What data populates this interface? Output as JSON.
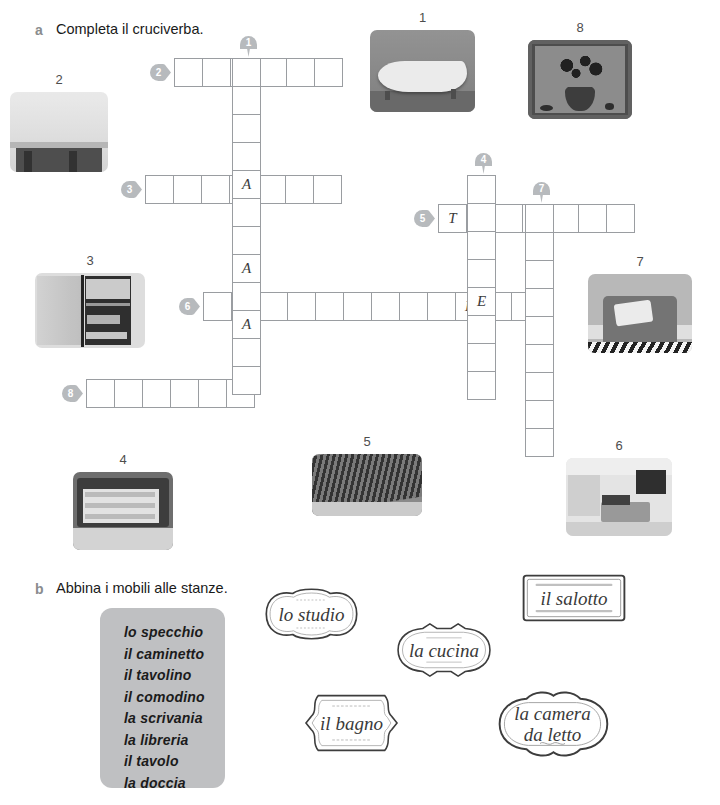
{
  "page": {
    "width": 720,
    "height": 805,
    "background": "#ffffff",
    "grid_border_color": "#9a9da1",
    "pin_color": "#b7babd",
    "wordbox_color": "#bfc0c2"
  },
  "exercise_a": {
    "letter": "a",
    "title": "Completa il cruciverba."
  },
  "exercise_b": {
    "letter": "b",
    "title": "Abbina i mobili alle stanze."
  },
  "crossword": {
    "cell_size": 29,
    "entries": [
      {
        "number": "2",
        "direction": "across",
        "x": 174,
        "y": 58,
        "cells": 6,
        "letters": [
          "",
          "",
          "",
          "",
          "",
          ""
        ]
      },
      {
        "number": "3",
        "direction": "across",
        "x": 145,
        "y": 175,
        "cells": 7,
        "letters": [
          "",
          "",
          "",
          "A",
          "",
          "",
          ""
        ]
      },
      {
        "number": "5",
        "direction": "across",
        "x": 438,
        "y": 204,
        "cells": 7,
        "letters": [
          "T",
          "",
          "",
          "",
          "",
          "",
          ""
        ]
      },
      {
        "number": "6",
        "direction": "across",
        "x": 203,
        "y": 292,
        "cells": 12,
        "letters": [
          "",
          "A",
          "",
          "",
          "",
          "",
          "",
          "",
          "",
          "E",
          "",
          ""
        ]
      },
      {
        "number": "8",
        "direction": "across",
        "x": 86,
        "y": 379,
        "cells": 6,
        "letters": [
          "",
          "",
          "",
          "",
          "",
          ""
        ]
      },
      {
        "number": "1",
        "direction": "down",
        "x": 232,
        "y": 58,
        "cells": 12,
        "letters": [
          "",
          "",
          "",
          "",
          "A",
          "",
          "",
          "A",
          "",
          "A",
          "",
          ""
        ]
      },
      {
        "number": "4",
        "direction": "down",
        "x": 467,
        "y": 175,
        "cells": 8,
        "letters": [
          "",
          "",
          "",
          "",
          "E",
          "",
          "",
          ""
        ]
      },
      {
        "number": "7",
        "direction": "down",
        "x": 525,
        "y": 204,
        "cells": 9,
        "letters": [
          "",
          "",
          "",
          "",
          "",
          "",
          "",
          "",
          ""
        ]
      }
    ],
    "pins": [
      {
        "number": "1",
        "style": "down",
        "x": 240,
        "y": 36
      },
      {
        "number": "2",
        "style": "right",
        "x": 150,
        "y": 64
      },
      {
        "number": "3",
        "style": "right",
        "x": 121,
        "y": 181
      },
      {
        "number": "4",
        "style": "down",
        "x": 475,
        "y": 153
      },
      {
        "number": "5",
        "style": "right",
        "x": 414,
        "y": 210
      },
      {
        "number": "6",
        "style": "right",
        "x": 179,
        "y": 298
      },
      {
        "number": "7",
        "style": "down",
        "x": 533,
        "y": 182
      },
      {
        "number": "8",
        "style": "right",
        "x": 62,
        "y": 385
      }
    ]
  },
  "photos": [
    {
      "id": "photo-1",
      "number": "1",
      "subject": "bathtub",
      "x": 370,
      "y": 30,
      "w": 105,
      "h": 82
    },
    {
      "id": "photo-2",
      "number": "2",
      "subject": "fireplace",
      "x": 10,
      "y": 92,
      "w": 98,
      "h": 80
    },
    {
      "id": "photo-3",
      "number": "3",
      "subject": "bookcase",
      "x": 35,
      "y": 273,
      "w": 110,
      "h": 75
    },
    {
      "id": "photo-4",
      "number": "4",
      "subject": "chest-drawer",
      "x": 73,
      "y": 472,
      "w": 100,
      "h": 78
    },
    {
      "id": "photo-5",
      "number": "5",
      "subject": "carpet-rug",
      "x": 312,
      "y": 454,
      "w": 110,
      "h": 62
    },
    {
      "id": "photo-6",
      "number": "6",
      "subject": "bedroom",
      "x": 566,
      "y": 458,
      "w": 106,
      "h": 78
    },
    {
      "id": "photo-7",
      "number": "7",
      "subject": "armchair",
      "x": 588,
      "y": 274,
      "w": 104,
      "h": 79
    },
    {
      "id": "photo-8",
      "number": "8",
      "subject": "flower-vase-picture",
      "x": 528,
      "y": 40,
      "w": 104,
      "h": 79
    }
  ],
  "wordbox": {
    "x": 100,
    "y": 608,
    "w": 125,
    "h": 180,
    "items": [
      "lo specchio",
      "il caminetto",
      "il tavolino",
      "il comodino",
      "la scrivania",
      "la libreria",
      "il tavolo",
      "la doccia"
    ]
  },
  "room_labels": [
    {
      "id": "lo-studio",
      "text": "lo studio",
      "shape": "wavy-oval",
      "x": 255,
      "y": 586,
      "w": 113,
      "h": 56
    },
    {
      "id": "il-salotto",
      "text": "il salotto",
      "shape": "rectangle",
      "x": 518,
      "y": 570,
      "w": 112,
      "h": 56
    },
    {
      "id": "la-cucina",
      "text": "la cucina",
      "shape": "pointed-oval",
      "x": 391,
      "y": 622,
      "w": 106,
      "h": 56
    },
    {
      "id": "il-bagno",
      "text": "il bagno",
      "shape": "bracket",
      "x": 299,
      "y": 690,
      "w": 105,
      "h": 66
    },
    {
      "id": "la-camera-da-letto",
      "text": "la camera\nda letto",
      "shape": "scallop",
      "x": 490,
      "y": 688,
      "w": 125,
      "h": 72
    }
  ]
}
